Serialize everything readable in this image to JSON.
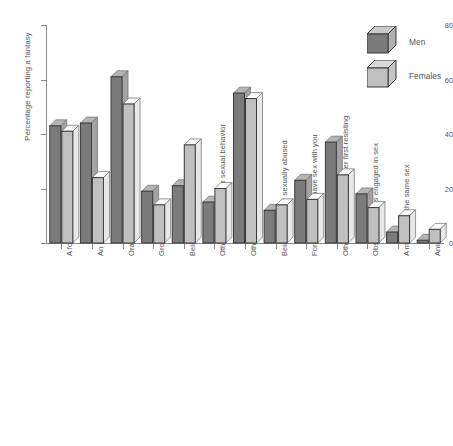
{
  "chart_data": {
    "type": "bar",
    "title": "",
    "xlabel": "",
    "ylabel": "Percentage reporting a fantasy",
    "ylim": [
      0,
      80
    ],
    "yticks": [
      0,
      20,
      40,
      60,
      80
    ],
    "grid": false,
    "legend_position": "top-right",
    "categories": [
      "A former lover",
      "An imaginary lover",
      "Oral-genital sex",
      "Group sex",
      "Being forced or overpowered",
      "Others observing your sexual behavior",
      "Others finding you sexually irresistible",
      "Being rejected or sexually abused",
      "Forcing others to have sex with you",
      "Others giving in to you after first resisting",
      "Observing others engaged in sex",
      "A member of the same sex",
      "Animals"
    ],
    "series": [
      {
        "name": "Men",
        "color": "#7b7b7b",
        "values": [
          43,
          44,
          61,
          19,
          21,
          15,
          55,
          12,
          23,
          37,
          18,
          4,
          1
        ]
      },
      {
        "name": "Females",
        "color": "#c0c0c0",
        "values": [
          41,
          24,
          51,
          14,
          36,
          20,
          53,
          14,
          16,
          25,
          13,
          10,
          5
        ]
      }
    ]
  },
  "legend": {
    "items": [
      {
        "label": "Men"
      },
      {
        "label": "Females"
      }
    ]
  },
  "axis": {
    "y_title": "Percentage reporting a fantasy",
    "y_ticks": [
      "0",
      "20",
      "40",
      "60",
      "80"
    ]
  }
}
